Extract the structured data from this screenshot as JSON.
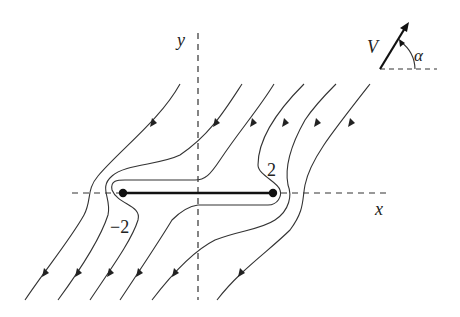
{
  "diagram": {
    "axes": {
      "x_label": "x",
      "y_label": "y"
    },
    "plate": {
      "left_label": "−2",
      "right_label": "2"
    },
    "inset": {
      "velocity_label": "V",
      "angle_label": "α"
    },
    "colors": {
      "line": "#333333",
      "background": "#ffffff"
    }
  }
}
